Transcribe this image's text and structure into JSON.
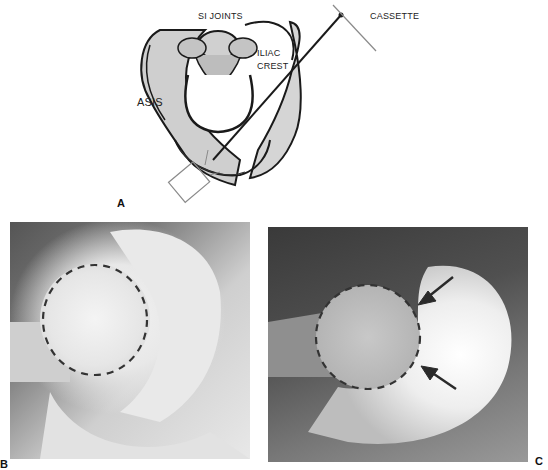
{
  "figure": {
    "panels": [
      {
        "id": "A",
        "letter": "A",
        "kind": "line-drawing",
        "description": "Pelvis drawing with x-ray beam and cassette positioning",
        "labels": {
          "si_joints": "SI JOINTS",
          "cassette": "CASSETTE",
          "iliac": "ILIAC",
          "crest": "CREST",
          "asis": "ASIS"
        }
      },
      {
        "id": "B",
        "letter": "B",
        "kind": "radiograph",
        "description": "Hip radiograph with dashed circle outlining femoral head"
      },
      {
        "id": "C",
        "letter": "C",
        "kind": "radiograph",
        "description": "Hip radiograph with dashed circle outlining femoral head and two arrows indicating head-neck junction"
      }
    ],
    "colors": {
      "ink": "#1a1a1a",
      "line_gray": "#8a8a8a",
      "dash": "#333333",
      "arrow": "#2a2a2a"
    }
  }
}
